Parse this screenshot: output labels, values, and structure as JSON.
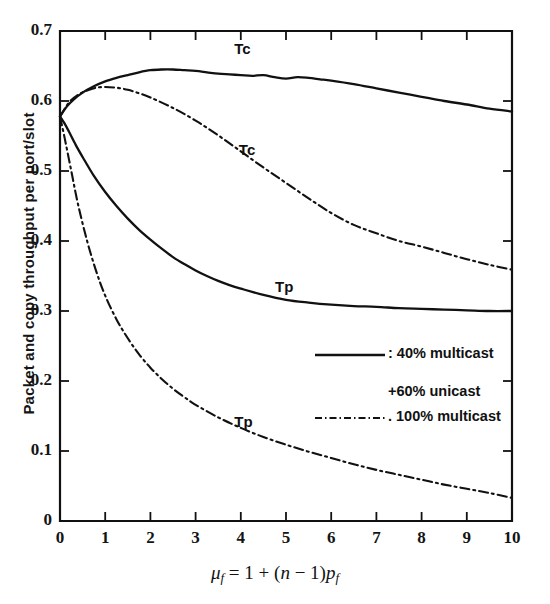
{
  "chart_data": {
    "type": "line",
    "title": "",
    "xlabel": "μ_f = 1 + (n − 1)p_f",
    "ylabel": "Packet and copy throughput per port/slot",
    "xlim": [
      0,
      10
    ],
    "ylim": [
      0,
      0.7
    ],
    "grid": false,
    "xticks": [
      "0",
      "1",
      "2",
      "3",
      "4",
      "5",
      "6",
      "7",
      "8",
      "9",
      "10"
    ],
    "yticks": [
      "0",
      "0.1",
      "0.2",
      "0.3",
      "0.4",
      "0.5",
      "0.6",
      "0.7"
    ],
    "legend_position": "inside-right-middle",
    "series": [
      {
        "name": "Tc",
        "label": "Tc",
        "style": "solid",
        "legend": "40% multicast +60% unicast",
        "x": [
          0,
          0.15,
          0.3,
          0.5,
          0.75,
          1.0,
          1.25,
          1.5,
          1.75,
          2.0,
          2.25,
          2.5,
          2.75,
          3.0,
          3.25,
          3.5,
          3.75,
          4.0,
          4.25,
          4.5,
          4.75,
          5.0,
          5.25,
          5.5,
          5.75,
          6.0,
          6.5,
          7.0,
          7.5,
          8.0,
          8.5,
          9.0,
          9.5,
          10.0
        ],
        "y": [
          0.578,
          0.592,
          0.602,
          0.612,
          0.621,
          0.628,
          0.633,
          0.637,
          0.641,
          0.644,
          0.645,
          0.645,
          0.644,
          0.643,
          0.641,
          0.639,
          0.638,
          0.637,
          0.636,
          0.637,
          0.634,
          0.632,
          0.634,
          0.633,
          0.631,
          0.629,
          0.624,
          0.618,
          0.612,
          0.606,
          0.6,
          0.595,
          0.589,
          0.585
        ]
      },
      {
        "name": "Tc-100",
        "label": "Tc",
        "style": "dash-dot",
        "legend": "100% multicast",
        "x": [
          0,
          0.2,
          0.4,
          0.6,
          0.8,
          1.0,
          1.25,
          1.5,
          1.75,
          2.0,
          2.5,
          3.0,
          3.5,
          4.0,
          4.5,
          5.0,
          5.5,
          6.0,
          6.5,
          7.0,
          7.5,
          8.0,
          8.5,
          9.0,
          9.5,
          10.0
        ],
        "y": [
          0.578,
          0.598,
          0.609,
          0.615,
          0.619,
          0.62,
          0.619,
          0.616,
          0.611,
          0.605,
          0.59,
          0.572,
          0.551,
          0.528,
          0.505,
          0.483,
          0.461,
          0.44,
          0.423,
          0.411,
          0.4,
          0.392,
          0.383,
          0.374,
          0.366,
          0.359
        ]
      },
      {
        "name": "Tp",
        "label": "Tp",
        "style": "solid",
        "legend": "40% multicast +60% unicast",
        "x": [
          0,
          0.1,
          0.2,
          0.35,
          0.5,
          0.75,
          1.0,
          1.25,
          1.5,
          1.75,
          2.0,
          2.25,
          2.5,
          2.75,
          3.0,
          3.25,
          3.5,
          3.75,
          4.0,
          4.5,
          5.0,
          5.5,
          6.0,
          6.5,
          7.0,
          7.5,
          8.0,
          8.5,
          9.0,
          9.5,
          10.0
        ],
        "y": [
          0.578,
          0.568,
          0.556,
          0.537,
          0.52,
          0.493,
          0.47,
          0.45,
          0.432,
          0.416,
          0.402,
          0.389,
          0.377,
          0.367,
          0.358,
          0.35,
          0.343,
          0.337,
          0.332,
          0.323,
          0.316,
          0.312,
          0.309,
          0.307,
          0.306,
          0.304,
          0.303,
          0.302,
          0.301,
          0.3,
          0.3
        ]
      },
      {
        "name": "Tp-100",
        "label": "Tp",
        "style": "dash-dot",
        "legend": "100% multicast",
        "x": [
          0,
          0.1,
          0.25,
          0.4,
          0.6,
          0.8,
          1.0,
          1.25,
          1.5,
          1.75,
          2.0,
          2.25,
          2.5,
          2.75,
          3.0,
          3.5,
          4.0,
          4.5,
          5.0,
          5.5,
          6.0,
          6.5,
          7.0,
          7.5,
          8.0,
          8.5,
          9.0,
          9.5,
          10.0
        ],
        "y": [
          0.578,
          0.548,
          0.5,
          0.452,
          0.4,
          0.357,
          0.322,
          0.288,
          0.261,
          0.238,
          0.219,
          0.203,
          0.189,
          0.177,
          0.166,
          0.148,
          0.133,
          0.12,
          0.109,
          0.099,
          0.09,
          0.081,
          0.073,
          0.066,
          0.059,
          0.052,
          0.046,
          0.04,
          0.033
        ]
      }
    ],
    "annotations": [
      {
        "text": "Tc",
        "x": 4.1,
        "y": 0.672
      },
      {
        "text": "Tc",
        "x": 4.2,
        "y": 0.527
      },
      {
        "text": "Tp",
        "x": 5.0,
        "y": 0.332
      },
      {
        "text": "Tp",
        "x": 4.1,
        "y": 0.138
      }
    ],
    "legend_entries": [
      {
        "style": "solid",
        "label": ": 40% multicast"
      },
      {
        "style": "none",
        "label": "+60% unicast"
      },
      {
        "style": "dash-dot",
        "label": ". 100% multicast"
      }
    ]
  }
}
